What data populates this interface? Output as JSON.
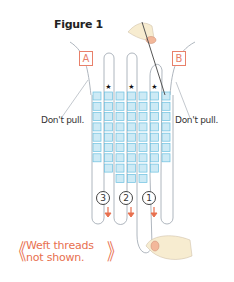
{
  "figure": {
    "title": "Figure 1",
    "labels": {
      "left": "A",
      "right": "B"
    },
    "callouts": {
      "left": "Don't pull.",
      "right": "Don't pull."
    },
    "steps": [
      "3",
      "2",
      "1"
    ],
    "note_line1": "Weft threads",
    "note_line2": "not shown.",
    "note_bracket_open": "《",
    "note_bracket_close": "》",
    "bead_columns": [
      7,
      8,
      9,
      9,
      9,
      8,
      7
    ],
    "star_columns": [
      2,
      4,
      6
    ],
    "colors": {
      "bead_fill": "#cdeaf5",
      "bead_stroke": "#6cc0e0",
      "thread": "#9aa3ad",
      "accent": "#e8704f",
      "skin": "#f7dcc0"
    }
  }
}
